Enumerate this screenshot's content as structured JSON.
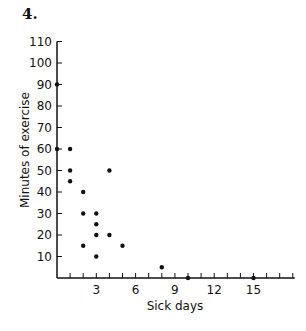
{
  "problem_number": "4.",
  "chart_data": {
    "type": "scatter",
    "title": "",
    "xlabel": "Sick days",
    "ylabel": "Minutes of exercise",
    "xlim": [
      0,
      18
    ],
    "ylim": [
      0,
      110
    ],
    "x_ticks": [
      1,
      2,
      3,
      4,
      5,
      6,
      7,
      8,
      9,
      10,
      11,
      12,
      13,
      14,
      15,
      16,
      17,
      18
    ],
    "x_tick_labels": [
      {
        "value": 3,
        "label": "3"
      },
      {
        "value": 6,
        "label": "6"
      },
      {
        "value": 9,
        "label": "9"
      },
      {
        "value": 12,
        "label": "12"
      },
      {
        "value": 15,
        "label": "15"
      }
    ],
    "y_ticks": [
      10,
      20,
      30,
      40,
      50,
      60,
      70,
      80,
      90,
      100,
      110
    ],
    "y_tick_labels": [
      {
        "value": 10,
        "label": "10"
      },
      {
        "value": 20,
        "label": "20"
      },
      {
        "value": 30,
        "label": "30"
      },
      {
        "value": 40,
        "label": "40"
      },
      {
        "value": 50,
        "label": "50"
      },
      {
        "value": 60,
        "label": "60"
      },
      {
        "value": 70,
        "label": "70"
      },
      {
        "value": 80,
        "label": "80"
      },
      {
        "value": 90,
        "label": "90"
      },
      {
        "value": 100,
        "label": "100"
      },
      {
        "value": 110,
        "label": "110"
      }
    ],
    "grid": false,
    "legend": null,
    "points": [
      {
        "x": 0,
        "y": 90
      },
      {
        "x": 0,
        "y": 60
      },
      {
        "x": 1,
        "y": 60
      },
      {
        "x": 1,
        "y": 50
      },
      {
        "x": 1,
        "y": 45
      },
      {
        "x": 2,
        "y": 40
      },
      {
        "x": 2,
        "y": 30
      },
      {
        "x": 2,
        "y": 15
      },
      {
        "x": 3,
        "y": 30
      },
      {
        "x": 3,
        "y": 25
      },
      {
        "x": 3,
        "y": 20
      },
      {
        "x": 3,
        "y": 10
      },
      {
        "x": 4,
        "y": 50
      },
      {
        "x": 4,
        "y": 20
      },
      {
        "x": 5,
        "y": 15
      },
      {
        "x": 8,
        "y": 5
      },
      {
        "x": 10,
        "y": 0
      },
      {
        "x": 15,
        "y": 0
      }
    ]
  }
}
